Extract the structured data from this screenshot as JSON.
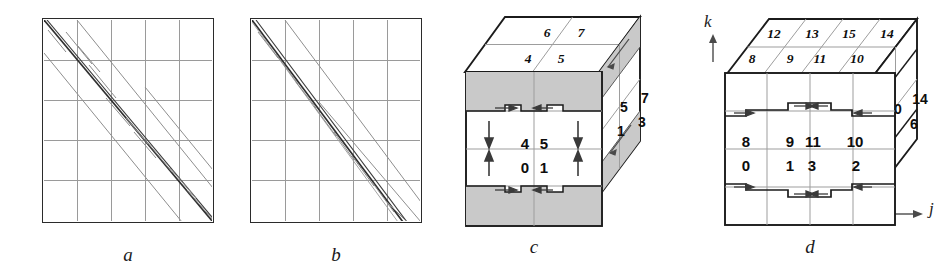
{
  "figure": {
    "caption_a": "a",
    "caption_b": "b",
    "caption_c": "c",
    "caption_d": "d"
  },
  "axes": {
    "vertical_label": "k",
    "horizontal_label": "j"
  },
  "panel_a": {
    "name": "matrix-sparsity-pattern-a",
    "grid_divisions": 5,
    "description": "square matrix sparsity plot with banded diagonal stripes"
  },
  "panel_b": {
    "name": "matrix-sparsity-pattern-b",
    "grid_divisions": 5,
    "description": "square matrix sparsity plot with banded diagonal stripes"
  },
  "panel_c": {
    "name": "morton-order-cube-2x2x2",
    "top_face": {
      "back_row": [
        "6",
        "7"
      ],
      "front_row": [
        "4",
        "5"
      ]
    },
    "front_face": {
      "upper_row": [
        "4",
        "5"
      ],
      "lower_row": [
        "0",
        "1"
      ]
    },
    "right_face": {
      "upper_row": [
        "5",
        "7"
      ],
      "lower_row": [
        "1",
        "3"
      ]
    }
  },
  "panel_d": {
    "name": "morton-order-cube-4x4x4",
    "top_face": {
      "back_row": [
        "12",
        "13",
        "15",
        "14"
      ],
      "front_row": [
        "8",
        "9",
        "11",
        "10"
      ]
    },
    "front_face": {
      "upper_row": [
        "8",
        "9",
        "11",
        "10"
      ],
      "lower_row": [
        "0",
        "1",
        "3",
        "2"
      ]
    },
    "right_face": {
      "upper_row": [
        "10",
        "14"
      ],
      "lower_row": [
        "2",
        "6"
      ]
    }
  },
  "colors": {
    "outline": "#1b1b1b",
    "grid": "#9d9d9d",
    "shade": "#c9c9c9",
    "diagonal_strong": "#333333",
    "diagonal_faint": "#8a8a8a",
    "background": "#ffffff"
  }
}
